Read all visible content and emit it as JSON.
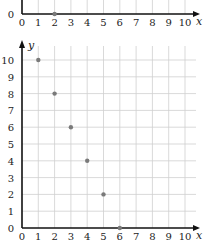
{
  "chart_data": [
    {
      "type": "scatter",
      "partial": true,
      "title": "",
      "xlabel": "x",
      "ylabel": "y",
      "xlim": [
        0,
        10
      ],
      "visible_y_ticks": [
        "0"
      ],
      "x_ticks": [
        "0",
        "1",
        "2",
        "3",
        "4",
        "5",
        "6",
        "7",
        "8",
        "9",
        "10"
      ],
      "points": [
        {
          "x": 2,
          "y": 0
        }
      ],
      "grid": true
    },
    {
      "type": "scatter",
      "title": "",
      "xlabel": "x",
      "ylabel": "y",
      "xlim": [
        0,
        10
      ],
      "ylim": [
        0,
        10
      ],
      "x_ticks": [
        "0",
        "1",
        "2",
        "3",
        "4",
        "5",
        "6",
        "7",
        "8",
        "9",
        "10"
      ],
      "y_ticks": [
        "0",
        "1",
        "2",
        "3",
        "4",
        "5",
        "6",
        "7",
        "8",
        "9",
        "10"
      ],
      "points": [
        {
          "x": 1,
          "y": 10
        },
        {
          "x": 2,
          "y": 8
        },
        {
          "x": 3,
          "y": 6
        },
        {
          "x": 4,
          "y": 4
        },
        {
          "x": 5,
          "y": 2
        },
        {
          "x": 6,
          "y": 0
        }
      ],
      "grid": true
    }
  ],
  "colors": {
    "axis": "#111111",
    "grid": "#cfcfcf",
    "point": "#7a7a7a"
  }
}
